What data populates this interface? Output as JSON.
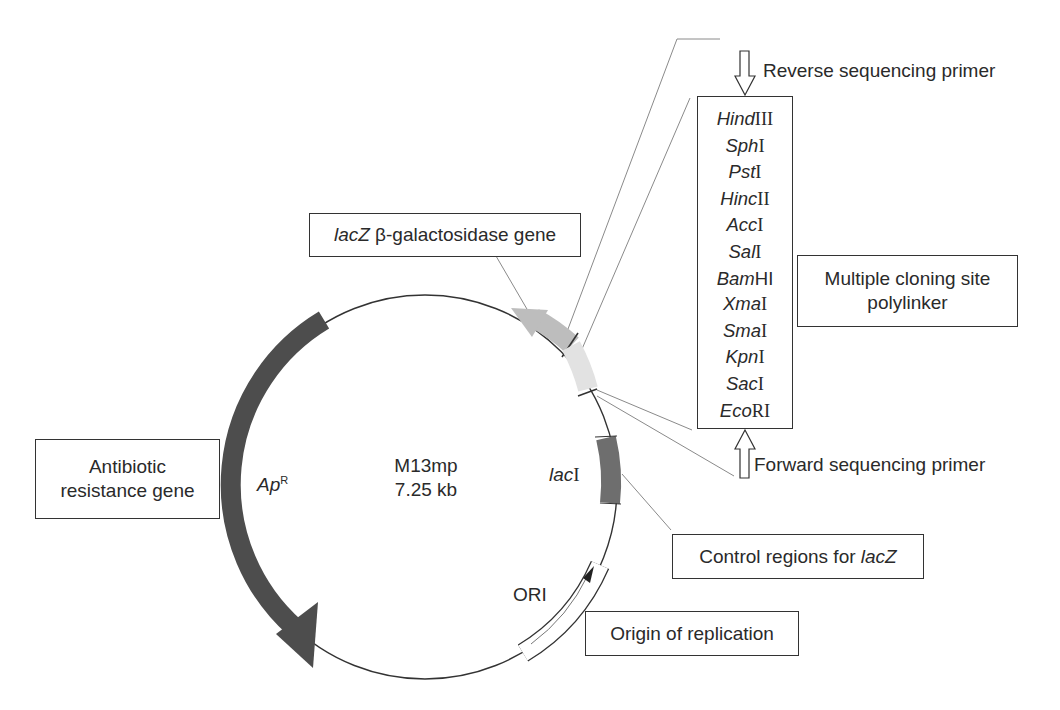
{
  "figure": {
    "plasmid": {
      "name": "M13mp",
      "size": "7.25 kb"
    },
    "features": [
      {
        "id": "apr",
        "label_italic": "Ap",
        "label_sup": "R",
        "color": "#4d4d4d",
        "type": "gene-arrow"
      },
      {
        "id": "lacz",
        "label": "lacZ β-galactosidase gene",
        "color": "#bdbdbd",
        "type": "gene-arrow"
      },
      {
        "id": "mcs",
        "color": "#e2e2e2",
        "type": "segment"
      },
      {
        "id": "laci",
        "label_italic": "lac",
        "label_roman": "I",
        "color": "#6e6e6e",
        "type": "segment"
      },
      {
        "id": "ori",
        "label": "ORI",
        "color": "#ffffff",
        "type": "outlined-segment"
      }
    ],
    "callouts": {
      "antibiotic": {
        "line1": "Antibiotic",
        "line2": "resistance gene"
      },
      "lacz": {
        "italic": "lacZ",
        "rest": " β-galactosidase gene"
      },
      "mcs": {
        "line1": "Multiple cloning site",
        "line2": "polylinker"
      },
      "control": {
        "text": "Control regions for ",
        "italic": "lacZ"
      },
      "origin": {
        "text": "Origin of replication"
      },
      "reverse_primer": "Reverse sequencing primer",
      "forward_primer": "Forward sequencing primer"
    },
    "restriction_sites": [
      {
        "italic": "Hind",
        "roman": "III"
      },
      {
        "italic": "Sph",
        "roman": "I"
      },
      {
        "italic": "Pst",
        "roman": "I"
      },
      {
        "italic": "Hinc",
        "roman": "II"
      },
      {
        "italic": "Acc",
        "roman": "I"
      },
      {
        "italic": "Sal",
        "roman": "I"
      },
      {
        "italic": "Bam",
        "roman": "HI"
      },
      {
        "italic": "Xma",
        "roman": "I"
      },
      {
        "italic": "Sma",
        "roman": "I"
      },
      {
        "italic": "Kpn",
        "roman": "I"
      },
      {
        "italic": "Sac",
        "roman": "I"
      },
      {
        "italic": "Eco",
        "roman": "RI"
      }
    ]
  }
}
